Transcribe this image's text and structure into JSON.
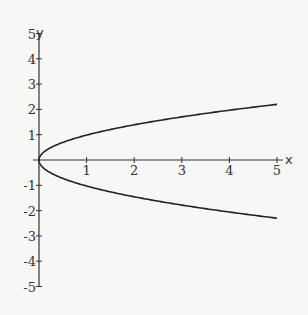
{
  "chart_data": {
    "type": "line",
    "title": "",
    "xlabel": "x",
    "ylabel": "y",
    "xlim": [
      0,
      5
    ],
    "ylim": [
      -5,
      5
    ],
    "grid": false,
    "x_ticks": [
      "1",
      "2",
      "3",
      "4",
      "5"
    ],
    "y_ticks": [
      "5",
      "4",
      "3",
      "2",
      "1",
      "-1",
      "-2",
      "-3",
      "-4",
      "-5"
    ],
    "series": [
      {
        "name": "upper branch y = sqrt(x)",
        "x": [
          0,
          0.25,
          0.5,
          1,
          2,
          3,
          4,
          5
        ],
        "y": [
          0,
          0.5,
          0.71,
          1.0,
          1.41,
          1.73,
          2.0,
          2.2
        ]
      },
      {
        "name": "lower branch y = -sqrt(x)",
        "x": [
          0,
          0.25,
          0.5,
          1,
          2,
          3,
          4,
          5
        ],
        "y": [
          0,
          -0.5,
          -0.71,
          -1.0,
          -1.45,
          -1.8,
          -2.05,
          -2.3
        ]
      }
    ]
  },
  "axes": {
    "x_label": "x",
    "y_label": "y"
  }
}
